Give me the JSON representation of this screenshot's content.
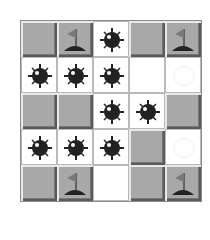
{
  "game": {
    "type": "minesweeper",
    "rows": 5,
    "cols": 5,
    "colors": {
      "covered": "#a8a8a8",
      "revealed": "#ffffff",
      "mine": "#222222",
      "flag": "#8a8a8a"
    },
    "grid": [
      [
        "covered",
        "flag",
        "mine",
        "covered",
        "flag"
      ],
      [
        "mine",
        "mine",
        "mine",
        "empty",
        "faint-circle"
      ],
      [
        "covered",
        "covered",
        "mine",
        "mine",
        "covered"
      ],
      [
        "mine",
        "mine",
        "mine",
        "covered",
        "faint-circle"
      ],
      [
        "covered",
        "flag",
        "empty",
        "covered",
        "flag"
      ]
    ]
  }
}
